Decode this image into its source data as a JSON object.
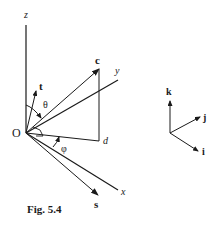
{
  "figure": {
    "caption": "Fig. 5.4",
    "origin_label": "O",
    "axes": {
      "x": "x",
      "y": "y",
      "z": "z"
    },
    "vectors": {
      "c": "c",
      "t": "t",
      "s": "s"
    },
    "points": {
      "d": "d"
    },
    "angles": {
      "theta": "θ",
      "phi": "φ"
    },
    "unit_triad": {
      "i": "i",
      "j": "j",
      "k": "k"
    },
    "colors": {
      "ink": "#1a1a1a",
      "background": "#ffffff"
    }
  }
}
